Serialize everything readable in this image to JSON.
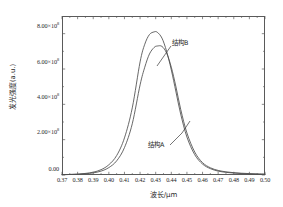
{
  "chart_data": {
    "type": "line",
    "title": "",
    "subtitle": "",
    "xlabel": "波长/μm",
    "ylabel": "发光强度(a.u.)",
    "xlim": [
      0.37,
      0.5
    ],
    "ylim": [
      0.0,
      900000000.0
    ],
    "grid": false,
    "legend_position": "none",
    "x_ticks": [
      0.37,
      0.38,
      0.39,
      0.4,
      0.41,
      0.42,
      0.43,
      0.44,
      0.45,
      0.46,
      0.47,
      0.48,
      0.49,
      0.5
    ],
    "x_tick_labels": [
      "0.37",
      "0.38",
      "0.39",
      "0.40",
      "0.41",
      "0.42",
      "0.43",
      "0.44",
      "0.45",
      "0.46",
      "0.47",
      "0.48",
      "0.49",
      "0.50"
    ],
    "y_ticks": [
      0,
      200000000,
      400000000,
      600000000,
      800000000
    ],
    "y_tick_labels": [
      {
        "mantissa": "0.00",
        "exponent": ""
      },
      {
        "mantissa": "2.00×10",
        "exponent": "8"
      },
      {
        "mantissa": "4.00×10",
        "exponent": "8"
      },
      {
        "mantissa": "6.00×10",
        "exponent": "8"
      },
      {
        "mantissa": "8.00×10",
        "exponent": "8"
      }
    ],
    "series": [
      {
        "name": "结构B",
        "color": "#4d4d4d",
        "peak_x": 0.431,
        "peak_y": 810000000,
        "x": [
          0.37,
          0.375,
          0.38,
          0.385,
          0.39,
          0.395,
          0.4,
          0.405,
          0.41,
          0.415,
          0.42,
          0.423,
          0.426,
          0.429,
          0.431,
          0.434,
          0.437,
          0.44,
          0.443,
          0.446,
          0.45,
          0.455,
          0.46,
          0.465,
          0.47,
          0.475,
          0.48,
          0.485,
          0.49,
          0.495,
          0.5
        ],
        "y": [
          2000000,
          3000000,
          5000000,
          9000000,
          16000000,
          30000000,
          58000000,
          110000000,
          210000000,
          380000000,
          640000000,
          740000000,
          795000000,
          810000000,
          808000000,
          775000000,
          700000000,
          595000000,
          470000000,
          345000000,
          215000000,
          115000000,
          62000000,
          36000000,
          22000000,
          15000000,
          11000000,
          8000000,
          6000000,
          5000000,
          4000000
        ]
      },
      {
        "name": "结构A",
        "color": "#4d4d4d",
        "peak_x": 0.433,
        "peak_y": 732000000,
        "x": [
          0.37,
          0.375,
          0.38,
          0.385,
          0.39,
          0.395,
          0.4,
          0.405,
          0.41,
          0.415,
          0.42,
          0.423,
          0.426,
          0.429,
          0.431,
          0.434,
          0.437,
          0.44,
          0.443,
          0.446,
          0.45,
          0.455,
          0.46,
          0.465,
          0.47,
          0.475,
          0.48,
          0.485,
          0.49,
          0.495,
          0.5
        ],
        "y": [
          2000000,
          3000000,
          4000000,
          7000000,
          12000000,
          22000000,
          42000000,
          80000000,
          155000000,
          290000000,
          510000000,
          610000000,
          685000000,
          722000000,
          730000000,
          728000000,
          690000000,
          610000000,
          498000000,
          372000000,
          238000000,
          130000000,
          70000000,
          41000000,
          26000000,
          18000000,
          13000000,
          10000000,
          8000000,
          6000000,
          5000000
        ]
      }
    ],
    "annotations": [
      {
        "text": "结构B",
        "target_series": "结构B",
        "label_x": 0.4465,
        "label_y": 705000000
      },
      {
        "text": "结构A",
        "target_series": "结构A",
        "label_x": 0.4325,
        "label_y": 128000000
      }
    ]
  }
}
